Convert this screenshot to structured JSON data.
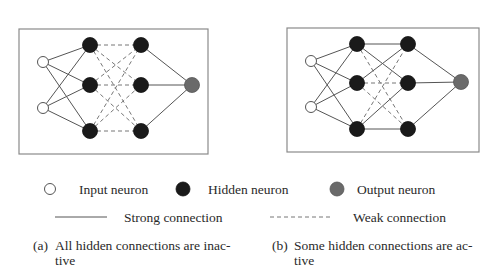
{
  "colors": {
    "frame": "#8a8a8a",
    "input_fill": "#ffffff",
    "hidden_fill": "#1a1a1a",
    "output_fill": "#6a6a6a",
    "edge": "#555555"
  },
  "panels": [
    {
      "id": "a",
      "frame": {
        "x": 19,
        "y": 29,
        "w": 189,
        "h": 125
      },
      "nodes": {
        "input": [
          {
            "x": 43,
            "y": 62
          },
          {
            "x": 43,
            "y": 108
          }
        ],
        "hidden1": [
          {
            "x": 90,
            "y": 45
          },
          {
            "x": 90,
            "y": 85
          },
          {
            "x": 90,
            "y": 131
          }
        ],
        "hidden2": [
          {
            "x": 141,
            "y": 45
          },
          {
            "x": 141,
            "y": 85
          },
          {
            "x": 141,
            "y": 131
          }
        ],
        "output": [
          {
            "x": 192,
            "y": 85
          }
        ]
      },
      "hidden_connections": [
        [
          "weak",
          "weak",
          "weak"
        ],
        [
          "weak",
          "weak",
          "weak"
        ],
        [
          "weak",
          "weak",
          "weak"
        ]
      ],
      "caption": {
        "label": "(a)",
        "line1": "All hidden connections are inac-",
        "line2": "tive"
      }
    },
    {
      "id": "b",
      "frame": {
        "x": 287,
        "y": 28,
        "w": 192,
        "h": 124
      },
      "nodes": {
        "input": [
          {
            "x": 311,
            "y": 61
          },
          {
            "x": 311,
            "y": 107
          }
        ],
        "hidden1": [
          {
            "x": 357,
            "y": 44
          },
          {
            "x": 357,
            "y": 83
          },
          {
            "x": 357,
            "y": 129
          }
        ],
        "hidden2": [
          {
            "x": 408,
            "y": 44
          },
          {
            "x": 408,
            "y": 83
          },
          {
            "x": 408,
            "y": 129
          }
        ],
        "output": [
          {
            "x": 461,
            "y": 82
          }
        ]
      },
      "hidden_connections": [
        [
          "strong",
          "strong",
          "weak"
        ],
        [
          "strong",
          "weak",
          "weak"
        ],
        [
          "weak",
          "strong",
          "strong"
        ]
      ],
      "caption": {
        "label": "(b)",
        "line1": "Some hidden connections are ac-",
        "line2": "tive"
      }
    }
  ],
  "legend": {
    "input_neuron": "Input neuron",
    "hidden_neuron": "Hidden neuron",
    "output_neuron": "Output neuron",
    "strong_connection": "Strong connection",
    "weak_connection": "Weak connection"
  },
  "radii": {
    "input": 5.5,
    "hidden": 7.5,
    "output": 7.5
  }
}
